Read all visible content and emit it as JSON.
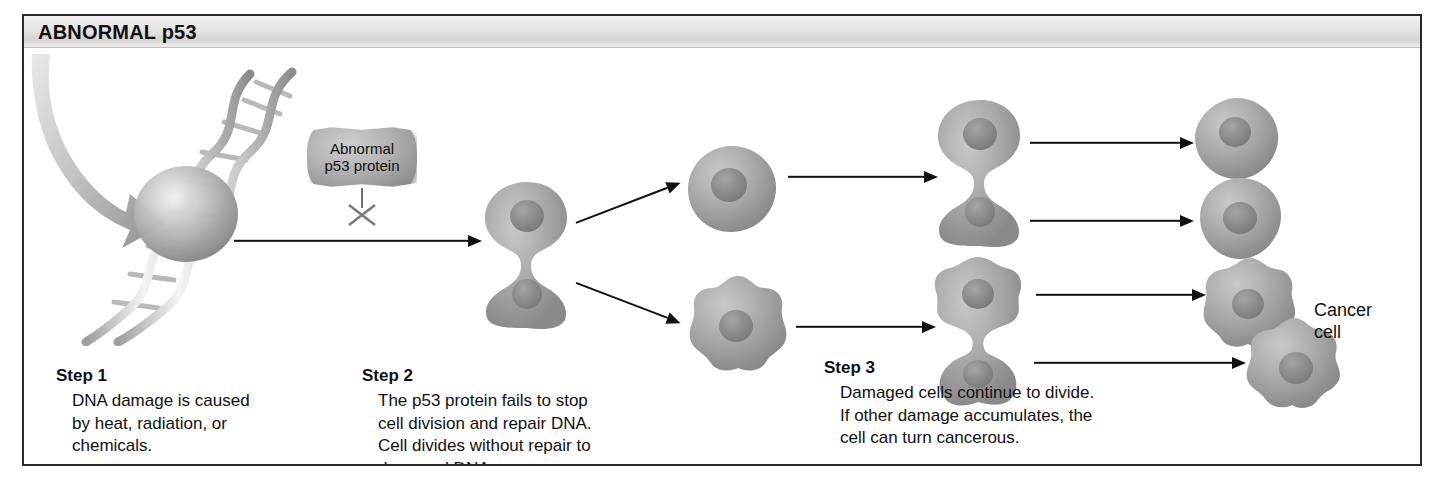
{
  "figure": {
    "header_title": "ABNORMAL p53",
    "border_color": "#2a2a2a",
    "background": "#ffffff"
  },
  "annotations": {
    "protein_label": "Abnormal\np53 protein",
    "protein_blocked_marker": "x-mark",
    "cancer_label": "Cancer\ncell"
  },
  "steps": [
    {
      "title": "Step 1",
      "body": "DNA damage is caused\nby heat, radiation, or\nchemicals."
    },
    {
      "title": "Step 2",
      "body": "The p53 protein fails to stop\ncell division and repair DNA.\nCell divides without repair to\ndamaged DNA."
    },
    {
      "title": "Step 3",
      "body": "Damaged cells continue to divide.\nIf other damage accumulates, the\ncell can turn cancerous."
    }
  ],
  "diagram": {
    "dna": {
      "name": "damaged-dna-double-helix",
      "damage_site": "gray-sphere-lesion"
    },
    "cells": [
      {
        "id": "c1",
        "kind": "dividing-cell",
        "x": 455,
        "y": 132,
        "w": 92,
        "h": 150
      },
      {
        "id": "c2",
        "kind": "round-cell",
        "x": 660,
        "y": 95,
        "w": 92,
        "h": 88
      },
      {
        "id": "c3",
        "kind": "lumpy-cell",
        "x": 663,
        "y": 228,
        "w": 100,
        "h": 96
      },
      {
        "id": "c4",
        "kind": "dividing-cell",
        "x": 910,
        "y": 50,
        "w": 92,
        "h": 150
      },
      {
        "id": "c5",
        "kind": "lumpy-dividing-cell",
        "x": 905,
        "y": 208,
        "w": 100,
        "h": 152
      },
      {
        "id": "c6",
        "kind": "round-cell",
        "x": 1168,
        "y": 50,
        "w": 86,
        "h": 82
      },
      {
        "id": "c7",
        "kind": "round-cell",
        "x": 1172,
        "y": 130,
        "w": 86,
        "h": 82
      },
      {
        "id": "c8",
        "kind": "lumpy-cell",
        "x": 1178,
        "y": 212,
        "w": 96,
        "h": 92
      },
      {
        "id": "c9",
        "kind": "cancer-cell",
        "x": 1222,
        "y": 272,
        "w": 96,
        "h": 92
      }
    ],
    "arrows": [
      {
        "id": "a1",
        "from": "dna",
        "to": "c1",
        "x": 210,
        "y": 186,
        "len": 248,
        "angle": 0
      },
      {
        "id": "a2",
        "from": "c1",
        "to": "c2",
        "x": 552,
        "y": 160,
        "len": 110,
        "angle": -20
      },
      {
        "id": "a3",
        "from": "c1",
        "to": "c3",
        "x": 552,
        "y": 228,
        "len": 110,
        "angle": 20
      },
      {
        "id": "a4",
        "from": "c2",
        "to": "c4",
        "x": 762,
        "y": 122,
        "len": 148,
        "angle": 0
      },
      {
        "id": "a5",
        "from": "c3",
        "to": "c5",
        "x": 772,
        "y": 272,
        "len": 138,
        "angle": 0
      },
      {
        "id": "a6",
        "from": "c4",
        "to": "c6",
        "x": 1005,
        "y": 88,
        "len": 162,
        "angle": 0
      },
      {
        "id": "a7",
        "from": "c4",
        "to": "c7",
        "x": 1005,
        "y": 164,
        "len": 162,
        "angle": 0
      },
      {
        "id": "a8",
        "from": "c5",
        "to": "c8",
        "x": 1010,
        "y": 240,
        "len": 168,
        "angle": 0
      },
      {
        "id": "a9",
        "from": "c5",
        "to": "c9",
        "x": 1010,
        "y": 308,
        "len": 210,
        "angle": 0
      }
    ],
    "damage_arrow": "curved-gray-damage-arrow"
  },
  "step_positions": [
    {
      "left": 32,
      "top": 318
    },
    {
      "left": 338,
      "top": 318
    },
    {
      "left": 800,
      "top": 310
    }
  ]
}
